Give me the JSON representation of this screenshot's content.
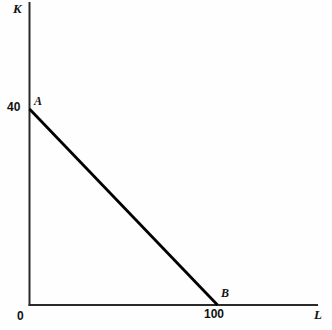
{
  "chart_data": {
    "type": "line",
    "title": "",
    "subtitle": "",
    "xlabel": "L",
    "ylabel": "K",
    "xlim": [
      0,
      120
    ],
    "ylim": [
      0,
      55
    ],
    "grid": false,
    "legend": null,
    "x": [
      0,
      100
    ],
    "values": [
      40,
      0
    ],
    "series": [
      {
        "name": "constraint-line",
        "x": [
          0,
          100
        ],
        "values": [
          40,
          0
        ],
        "color": "#000000"
      }
    ],
    "points": [
      {
        "label": "A",
        "x": 0,
        "y": 40
      },
      {
        "label": "B",
        "x": 100,
        "y": 0
      }
    ],
    "xticks": [
      0,
      100
    ],
    "xticklabels": [
      "0",
      "100"
    ],
    "yticks": [
      40
    ],
    "yticklabels": [
      "40"
    ],
    "annotations": [
      "A",
      "B"
    ]
  },
  "axes": {
    "y_axis_label": "K",
    "x_axis_label": "L",
    "origin_label": "0"
  },
  "ticks": {
    "y_forty": "40",
    "x_hundred": "100"
  },
  "points": {
    "a_label": "A",
    "b_label": "B"
  },
  "colors": {
    "background": "#fefefe",
    "axis": "#2a2a2a",
    "line": "#000000",
    "text": "#111111"
  }
}
